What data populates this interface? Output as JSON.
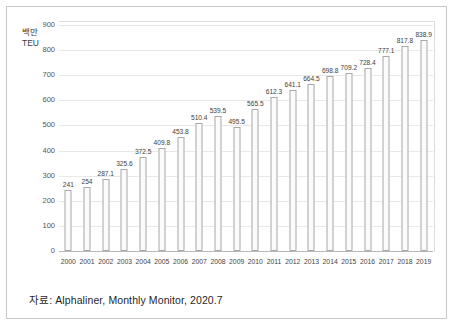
{
  "figure": {
    "unit_label": "백만\nTEU",
    "caption": "자료: Alphaliner, Monthly Monitor, 2020.7"
  },
  "colors": {
    "bar_fill": "#fbfbfb",
    "bar_border": "#a8a8a8",
    "gridline": "#e8e8e8",
    "axis_line": "#b9b9b9",
    "frame_border": "#c9c9c9",
    "text": "#1f1f1f"
  },
  "chart_data": {
    "type": "bar",
    "title": "",
    "subtitle": "",
    "xlabel": "",
    "ylabel": "백만 TEU",
    "categories": [
      "2000",
      "2001",
      "2002",
      "2003",
      "2004",
      "2005",
      "2006",
      "2007",
      "2008",
      "2009",
      "2010",
      "2011",
      "2012",
      "2013",
      "2014",
      "2015",
      "2016",
      "2017",
      "2018",
      "2019"
    ],
    "values": [
      241,
      254,
      287.1,
      325.6,
      372.5,
      409.8,
      453.8,
      510.4,
      539.5,
      495.5,
      565.5,
      612.3,
      641.1,
      664.5,
      698.8,
      709.2,
      728.4,
      777.1,
      817.8,
      838.9
    ],
    "value_labels": [
      "241",
      "254",
      "287.1",
      "325.6",
      "372.5",
      "409.8",
      "453.8",
      "510.4",
      "539.5",
      "495.5",
      "565.5",
      "612.3",
      "641.1",
      "664.5",
      "698.8",
      "709.2",
      "728.4",
      "777.1",
      "817.8",
      "838.9"
    ],
    "ylim": [
      0,
      900
    ],
    "yticks": [
      0,
      100,
      200,
      300,
      400,
      500,
      600,
      700,
      800,
      900
    ],
    "ytick_labels": [
      "0",
      "100",
      "200",
      "300",
      "400",
      "500",
      "600",
      "700",
      "800",
      "900"
    ],
    "grid": true,
    "grid_axis": "y",
    "legend": false,
    "legend_position": "none",
    "series": [
      {
        "name": "세계 컨테이너 물동량",
        "values": [
          241,
          254,
          287.1,
          325.6,
          372.5,
          409.8,
          453.8,
          510.4,
          539.5,
          495.5,
          565.5,
          612.3,
          641.1,
          664.5,
          698.8,
          709.2,
          728.4,
          777.1,
          817.8,
          838.9
        ]
      }
    ]
  }
}
